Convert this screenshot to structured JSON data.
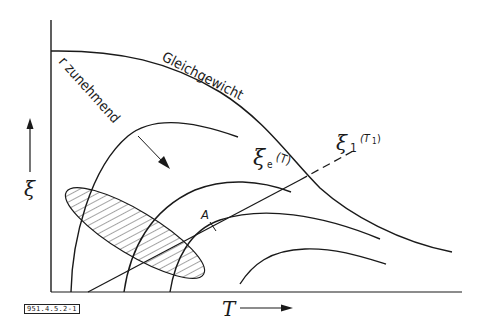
{
  "figure": {
    "id_label": "951.4.5.2-1",
    "y_axis_label": "ξ",
    "x_axis_label": "T",
    "equilibrium_label": "Gleichgewicht",
    "equilibrium_symbol": "ξ",
    "equilibrium_subscript": "e",
    "equilibrium_arg": "(T)",
    "operating_line_symbol": "ξ",
    "operating_line_subscript": "1",
    "operating_line_arg": "(T",
    "operating_line_arg_sub": "1",
    "operating_line_arg_close": ")",
    "family_label": "r zunehmend",
    "point_label": "A"
  },
  "colors": {
    "ink": "#1a1a1a",
    "background": "#ffffff"
  }
}
